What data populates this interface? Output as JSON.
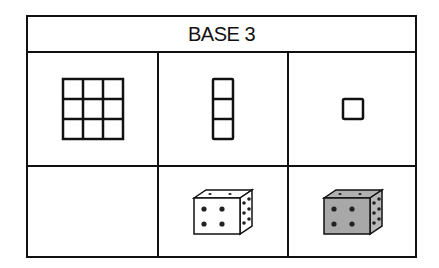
{
  "header": {
    "title": "BASE 3"
  },
  "rows": [
    {
      "cells": [
        {
          "label": "3x3 grid of units (nine)",
          "icon": "grid-3x3-icon"
        },
        {
          "label": "column of three units",
          "icon": "column-3-icon"
        },
        {
          "label": "single unit",
          "icon": "unit-square-icon"
        }
      ]
    },
    {
      "cells": [
        {
          "label": "",
          "icon": ""
        },
        {
          "label": "white die",
          "icon": "white-die-icon",
          "fill": "#ffffff"
        },
        {
          "label": "gray die",
          "icon": "gray-die-icon",
          "fill": "#a8a8a8"
        }
      ]
    }
  ]
}
